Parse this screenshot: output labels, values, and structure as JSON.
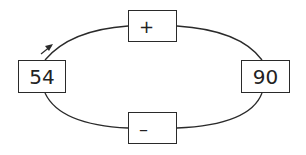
{
  "diagram": {
    "left_node": {
      "value": "54"
    },
    "right_node": {
      "value": "90"
    },
    "top_operation": {
      "symbol": "+"
    },
    "bottom_operation": {
      "symbol": "–"
    },
    "direction_arrow": "clockwise",
    "colors": {
      "stroke": "#2a2a2a",
      "background": "#ffffff",
      "text": "#222222"
    }
  }
}
